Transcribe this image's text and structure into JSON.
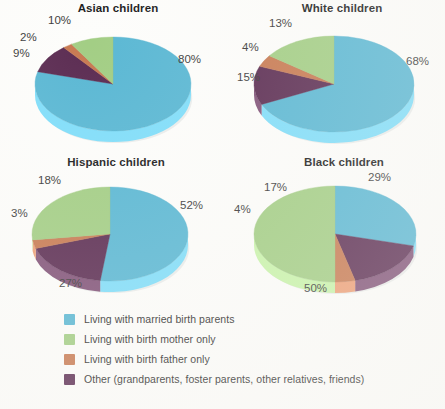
{
  "colors": {
    "married": "#5bb8d4",
    "married_side": "#a8d9e6",
    "mother": "#a3ce85",
    "mother_side": "#c6e0b1",
    "father": "#c87a52",
    "father_side": "#ddaa8c",
    "other": "#5c2d53",
    "other_side": "#8a6180",
    "label_text": "#3a3a3a",
    "title_text": "#1b1b1b",
    "background": "#fdfdfb"
  },
  "legend": {
    "items": [
      {
        "label": "Living with married birth parents",
        "color_key": "married",
        "swatch_name": "legend-swatch-married-birth-parents"
      },
      {
        "label": "Living with birth mother only",
        "color_key": "mother",
        "swatch_name": "legend-swatch-birth-mother-only"
      },
      {
        "label": "Living with birth father only",
        "color_key": "father",
        "swatch_name": "legend-swatch-birth-father-only"
      },
      {
        "label": "Other (grandparents, foster parents, other relatives, friends)",
        "color_key": "other",
        "swatch_name": "legend-swatch-other"
      }
    ]
  },
  "chart_data": [
    {
      "type": "pie",
      "title": "Asian children",
      "categories": [
        "Living with married birth parents",
        "Other (grandparents, foster parents, other relatives, friends)",
        "Living with birth father only",
        "Living with birth mother only"
      ],
      "values": [
        80,
        10,
        2,
        9
      ],
      "labels": [
        "80%",
        "10%",
        "2%",
        "9%"
      ],
      "xlabel": "",
      "ylabel": "",
      "legend_position": "bottom"
    },
    {
      "type": "pie",
      "title": "White children",
      "categories": [
        "Living with married birth parents",
        "Other (grandparents, foster parents, other relatives, friends)",
        "Living with birth father only",
        "Living with birth mother only"
      ],
      "values": [
        68,
        13,
        4,
        15
      ],
      "labels": [
        "68%",
        "13%",
        "4%",
        "15%"
      ],
      "xlabel": "",
      "ylabel": "",
      "legend_position": "bottom"
    },
    {
      "type": "pie",
      "title": "Hispanic children",
      "categories": [
        "Living with married birth parents",
        "Other (grandparents, foster parents, other relatives, friends)",
        "Living with birth father only",
        "Living with birth mother only"
      ],
      "values": [
        52,
        18,
        3,
        27
      ],
      "labels": [
        "52%",
        "18%",
        "3%",
        "27%"
      ],
      "xlabel": "",
      "ylabel": "",
      "legend_position": "bottom"
    },
    {
      "type": "pie",
      "title": "Black children",
      "categories": [
        "Living with married birth parents",
        "Other (grandparents, foster parents, other relatives, friends)",
        "Living with birth father only",
        "Living with birth mother only"
      ],
      "values": [
        29,
        17,
        4,
        50
      ],
      "labels": [
        "29%",
        "17%",
        "4%",
        "50%"
      ],
      "xlabel": "",
      "ylabel": "",
      "legend_position": "bottom"
    }
  ],
  "pie_layout": [
    {
      "panel": "tl",
      "cx": 113,
      "cy": 82,
      "rx": 78,
      "ry": 47,
      "depth": 11,
      "start_angle": -90,
      "label_positions": [
        {
          "text_key": 0,
          "x": 178,
          "y": 50,
          "name": "pct-label-married"
        },
        {
          "text_key": 1,
          "x": 48,
          "y": 11,
          "name": "pct-label-other"
        },
        {
          "text_key": 2,
          "x": 20,
          "y": 28,
          "name": "pct-label-father"
        },
        {
          "text_key": 3,
          "x": 13,
          "y": 44,
          "name": "pct-label-mother"
        }
      ]
    },
    {
      "panel": "tr",
      "cx": 112,
      "cy": 82,
      "rx": 80,
      "ry": 48,
      "depth": 11,
      "start_angle": -90,
      "label_positions": [
        {
          "text_key": 0,
          "x": 184,
          "y": 52,
          "name": "pct-label-married"
        },
        {
          "text_key": 1,
          "x": 47,
          "y": 14,
          "name": "pct-label-other"
        },
        {
          "text_key": 2,
          "x": 20,
          "y": 38,
          "name": "pct-label-father"
        },
        {
          "text_key": 3,
          "x": 15,
          "y": 68,
          "name": "pct-label-mother"
        }
      ]
    },
    {
      "panel": "bl",
      "cx": 110,
      "cy": 78,
      "rx": 78,
      "ry": 47,
      "depth": 11,
      "start_angle": -90,
      "label_positions": [
        {
          "text_key": 0,
          "x": 180,
          "y": 42,
          "name": "pct-label-married"
        },
        {
          "text_key": 1,
          "x": 38,
          "y": 17,
          "name": "pct-label-other"
        },
        {
          "text_key": 2,
          "x": 11,
          "y": 50,
          "name": "pct-label-father"
        },
        {
          "text_key": 3,
          "x": 59,
          "y": 120,
          "name": "pct-label-mother"
        }
      ]
    },
    {
      "panel": "br",
      "cx": 113,
      "cy": 78,
      "rx": 81,
      "ry": 48,
      "depth": 11,
      "start_angle": -90,
      "label_positions": [
        {
          "text_key": 0,
          "x": 146,
          "y": 14,
          "name": "pct-label-married"
        },
        {
          "text_key": 1,
          "x": 42,
          "y": 24,
          "name": "pct-label-other"
        },
        {
          "text_key": 2,
          "x": 12,
          "y": 46,
          "name": "pct-label-father"
        },
        {
          "text_key": 3,
          "x": 82,
          "y": 125,
          "name": "pct-label-mother"
        }
      ]
    }
  ],
  "slice_color_keys": [
    "married",
    "other",
    "father",
    "mother"
  ]
}
